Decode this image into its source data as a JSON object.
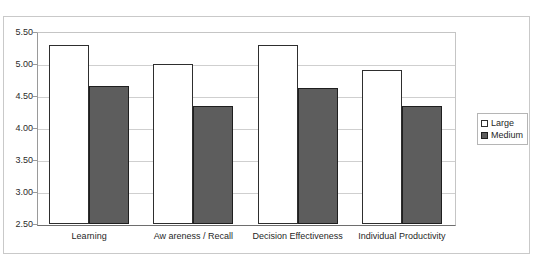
{
  "figure": {
    "ghost_title": "",
    "background_color": "#ffffff",
    "frame_color": "#c9c9c9"
  },
  "chart_data": {
    "type": "bar",
    "title": "",
    "xlabel": "",
    "ylabel": "",
    "ylim": [
      2.5,
      5.5
    ],
    "ytick_step": 0.5,
    "ytick_labels": [
      "5.50",
      "5.00",
      "4.50",
      "4.00",
      "3.50",
      "3.00",
      "2.50"
    ],
    "ytick_values": [
      5.5,
      5.0,
      4.5,
      4.0,
      3.5,
      3.0,
      2.5
    ],
    "grid": true,
    "grid_axis": "y",
    "legend_position": "right",
    "categories": [
      "Learning",
      "Aw areness / Recall",
      "Decision Effectiveness",
      "Individual Productivity"
    ],
    "series": [
      {
        "name": "Large",
        "color": "#ffffff",
        "edge_color": "#2e2e2e",
        "values": [
          5.3,
          5.0,
          5.3,
          4.9
        ]
      },
      {
        "name": "Medium",
        "color": "#5d5d5d",
        "edge_color": "#1f1f1f",
        "values": [
          4.65,
          4.35,
          4.63,
          4.35
        ]
      }
    ]
  },
  "legend": {
    "entries": [
      {
        "label": "Large"
      },
      {
        "label": "Medium"
      }
    ]
  }
}
